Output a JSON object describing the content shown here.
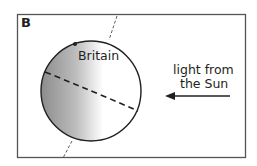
{
  "panel": {
    "letter": "B"
  },
  "labels": {
    "place": "Britain",
    "light_line1": "light from",
    "light_line2": "the Sun"
  },
  "colors": {
    "frame": "#555555",
    "ink": "#231f20",
    "shade_dark": "#8f8f8f",
    "shade_light": "#ffffff"
  }
}
